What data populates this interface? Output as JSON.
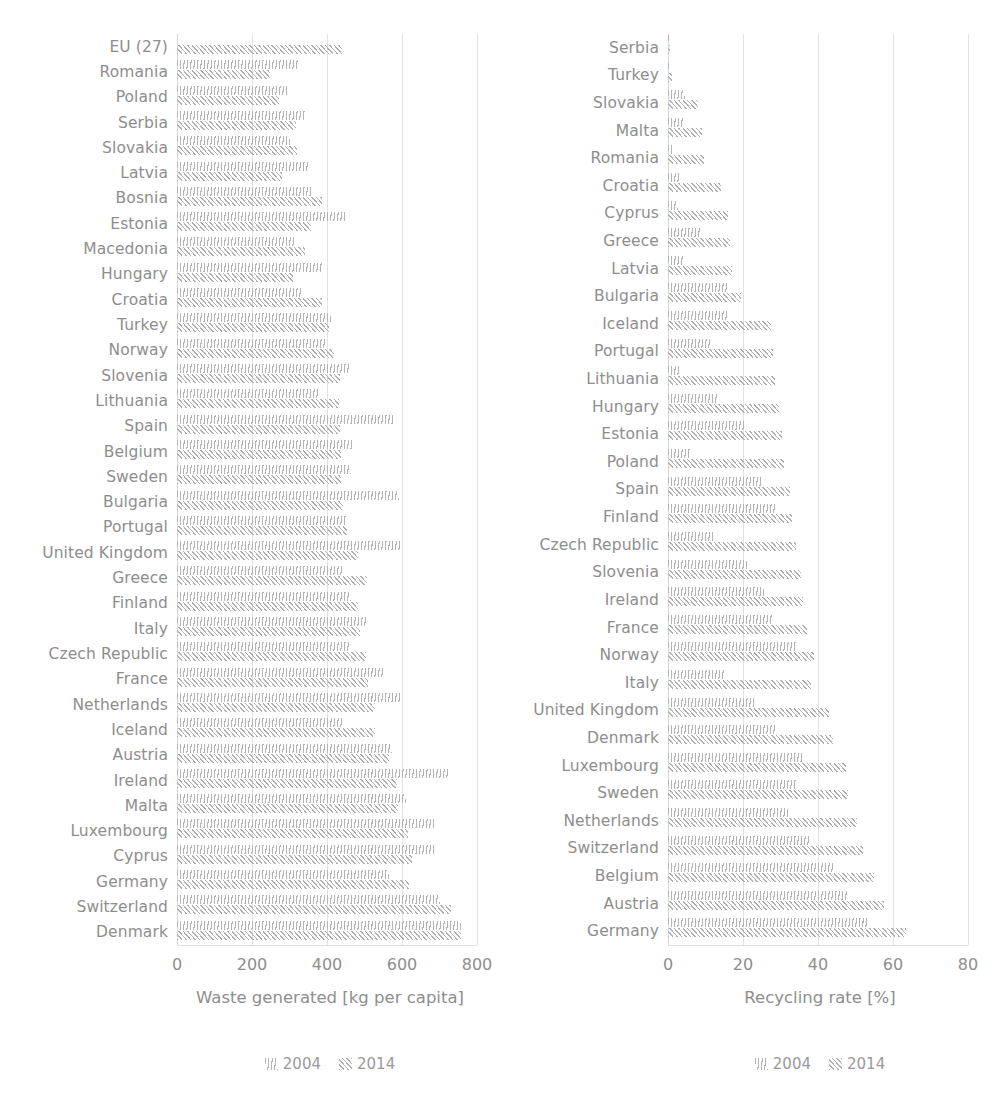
{
  "chart_data": [
    {
      "type": "bar",
      "orientation": "horizontal",
      "title": "",
      "xlabel": "Waste generated [kg per capita]",
      "ylabel": "",
      "xlim": [
        0,
        800
      ],
      "xticks": [
        0,
        200,
        400,
        600,
        800
      ],
      "grid": true,
      "legend_position": "bottom",
      "legend": [
        "2004",
        "2014"
      ],
      "categories": [
        "EU (27)",
        "Romania",
        "Poland",
        "Serbia",
        "Slovakia",
        "Latvia",
        "Bosnia",
        "Estonia",
        "Macedonia",
        "Hungary",
        "Croatia",
        "Turkey",
        "Norway",
        "Slovenia",
        "Lithuania",
        "Spain",
        "Belgium",
        "Sweden",
        "Bulgaria",
        "Portugal",
        "United Kingdom",
        "Greece",
        "Finland",
        "Italy",
        "Czech Republic",
        "France",
        "Netherlands",
        "Iceland",
        "Austria",
        "Ireland",
        "Malta",
        "Luxembourg",
        "Cyprus",
        "Germany",
        "Switzerland",
        "Denmark"
      ],
      "series": [
        {
          "name": "2004",
          "values": [
            null,
            322,
            295,
            343,
            300,
            350,
            363,
            449,
            316,
            390,
            330,
            411,
            398,
            462,
            379,
            580,
            470,
            465,
            591,
            451,
            600,
            444,
            465,
            507,
            460,
            552,
            600,
            442,
            573,
            725,
            610,
            690,
            690,
            565,
            700,
            757
          ]
        },
        {
          "name": "2014",
          "values": [
            441,
            249,
            272,
            316,
            321,
            281,
            387,
            357,
            342,
            309,
            387,
            405,
            418,
            434,
            433,
            435,
            438,
            438,
            442,
            453,
            482,
            506,
            482,
            488,
            504,
            509,
            527,
            529,
            565,
            586,
            590,
            616,
            626,
            618,
            730,
            758
          ]
        }
      ]
    },
    {
      "type": "bar",
      "orientation": "horizontal",
      "title": "",
      "xlabel": "Recycling rate [%]",
      "ylabel": "",
      "xlim": [
        0,
        80
      ],
      "xticks": [
        0,
        20,
        40,
        60,
        80
      ],
      "grid": true,
      "legend_position": "bottom",
      "legend": [
        "2004",
        "2014"
      ],
      "categories": [
        "Serbia",
        "Turkey",
        "Slovakia",
        "Malta",
        "Romania",
        "Croatia",
        "Cyprus",
        "Greece",
        "Latvia",
        "Bulgaria",
        "Iceland",
        "Portugal",
        "Lithuania",
        "Hungary",
        "Estonia",
        "Poland",
        "Spain",
        "Finland",
        "Czech Republic",
        "Slovenia",
        "Ireland",
        "France",
        "Norway",
        "Italy",
        "United Kingdom",
        "Denmark",
        "Luxembourg",
        "Sweden",
        "Netherlands",
        "Switzerland",
        "Belgium",
        "Austria",
        "Germany"
      ],
      "series": [
        {
          "name": "2004",
          "values": [
            0.4,
            0.8,
            4.4,
            4.3,
            1.0,
            3.5,
            2.6,
            8.5,
            4.2,
            16.0,
            15.6,
            11.3,
            3.0,
            13.0,
            20.2,
            6.0,
            24.8,
            28.8,
            12.0,
            21.0,
            25.5,
            28.0,
            34.0,
            15.0,
            23.0,
            29.0,
            36.0,
            34.0,
            32.0,
            38.0,
            44.0,
            48.0,
            53.0
          ]
        },
        {
          "name": "2014",
          "values": [
            0.6,
            1.0,
            8.0,
            9.0,
            9.5,
            14.0,
            16.0,
            16.5,
            17.0,
            19.5,
            27.5,
            28.0,
            28.5,
            29.5,
            30.5,
            31.0,
            32.5,
            33.0,
            34.0,
            35.5,
            36.0,
            37.0,
            39.0,
            38.0,
            43.0,
            44.0,
            47.5,
            48.0,
            50.5,
            52.0,
            55.0,
            57.5,
            63.5
          ]
        }
      ]
    }
  ],
  "panels": {
    "left": {
      "axis_title": "Waste generated [kg per capita]",
      "legend": [
        {
          "label": "2004",
          "pattern": "vertical-hatch"
        },
        {
          "label": "2014",
          "pattern": "diagonal-hatch"
        }
      ]
    },
    "right": {
      "axis_title": "Recycling rate [%]",
      "legend": [
        {
          "label": "2004",
          "pattern": "vertical-hatch"
        },
        {
          "label": "2014",
          "pattern": "diagonal-hatch"
        }
      ]
    }
  },
  "colors": {
    "text": "#8e8e8e",
    "gridline": "#e3e3e3",
    "bar_2004": "#b4b4b4",
    "bar_2014": "#b0b0b0",
    "background": "#ffffff"
  }
}
